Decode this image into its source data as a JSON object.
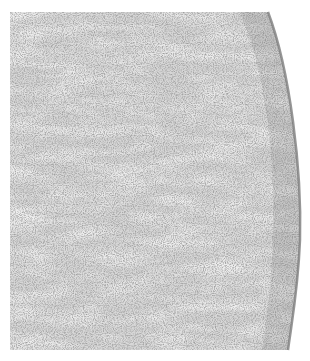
{
  "image": {
    "subject": "histology micrograph of spindle-cell tissue with curved capsule edge",
    "palette": {
      "background": "#ffffff",
      "tissue_base": "#d9d9d9",
      "stroma_light": "#e6e6e6",
      "nuclei": "#5a5a5a",
      "capsule_edge": "#8a8a8a"
    }
  }
}
